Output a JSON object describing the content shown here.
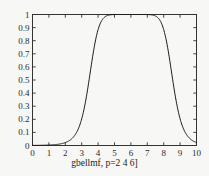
{
  "chart_data": {
    "type": "line",
    "title": "",
    "subtitle": "",
    "xlabel": "gbellmf, p=2 4 6]",
    "ylabel": "",
    "xlim": [
      0,
      10
    ],
    "ylim": [
      0,
      1
    ],
    "grid": false,
    "legend": null,
    "xticks": [
      "0",
      "1",
      "2",
      "3",
      "4",
      "5",
      "6",
      "7",
      "8",
      "9",
      "10"
    ],
    "xtick_values": [
      0,
      1,
      2,
      3,
      4,
      5,
      6,
      7,
      8,
      9,
      10
    ],
    "yticks": [
      "0",
      "0.1",
      "0.2",
      "0.3",
      "0.4",
      "0.5",
      "0.6",
      "0.7",
      "0.8",
      "0.9",
      "1"
    ],
    "ytick_values": [
      0,
      0.1,
      0.2,
      0.3,
      0.4,
      0.5,
      0.6,
      0.7,
      0.8,
      0.9,
      1
    ],
    "line_color": "#1a1a1a",
    "axis_color": "#333333",
    "background_color": "#f7f7f5",
    "series": [
      {
        "name": "gbellmf a=2 b=4 c=6",
        "x": [
          0.0,
          0.25,
          0.5,
          0.75,
          1.0,
          1.25,
          1.5,
          1.75,
          2.0,
          2.25,
          2.5,
          2.75,
          3.0,
          3.25,
          3.5,
          3.75,
          4.0,
          4.25,
          4.5,
          4.75,
          5.0,
          5.25,
          5.5,
          5.75,
          6.0,
          6.25,
          6.5,
          6.75,
          7.0,
          7.25,
          7.5,
          7.75,
          8.0,
          8.25,
          8.5,
          8.75,
          9.0,
          9.25,
          9.5,
          9.75,
          10.0
        ],
        "y": [
          0.001,
          0.001,
          0.002,
          0.003,
          0.004,
          0.006,
          0.009,
          0.013,
          0.02,
          0.031,
          0.048,
          0.075,
          0.118,
          0.185,
          0.285,
          0.419,
          0.568,
          0.705,
          0.81,
          0.881,
          0.925,
          0.953,
          0.97,
          0.981,
          0.985,
          0.981,
          0.97,
          0.953,
          0.925,
          0.881,
          0.81,
          0.705,
          0.568,
          0.419,
          0.285,
          0.185,
          0.118,
          0.075,
          0.048,
          0.031,
          0.02
        ]
      }
    ]
  }
}
